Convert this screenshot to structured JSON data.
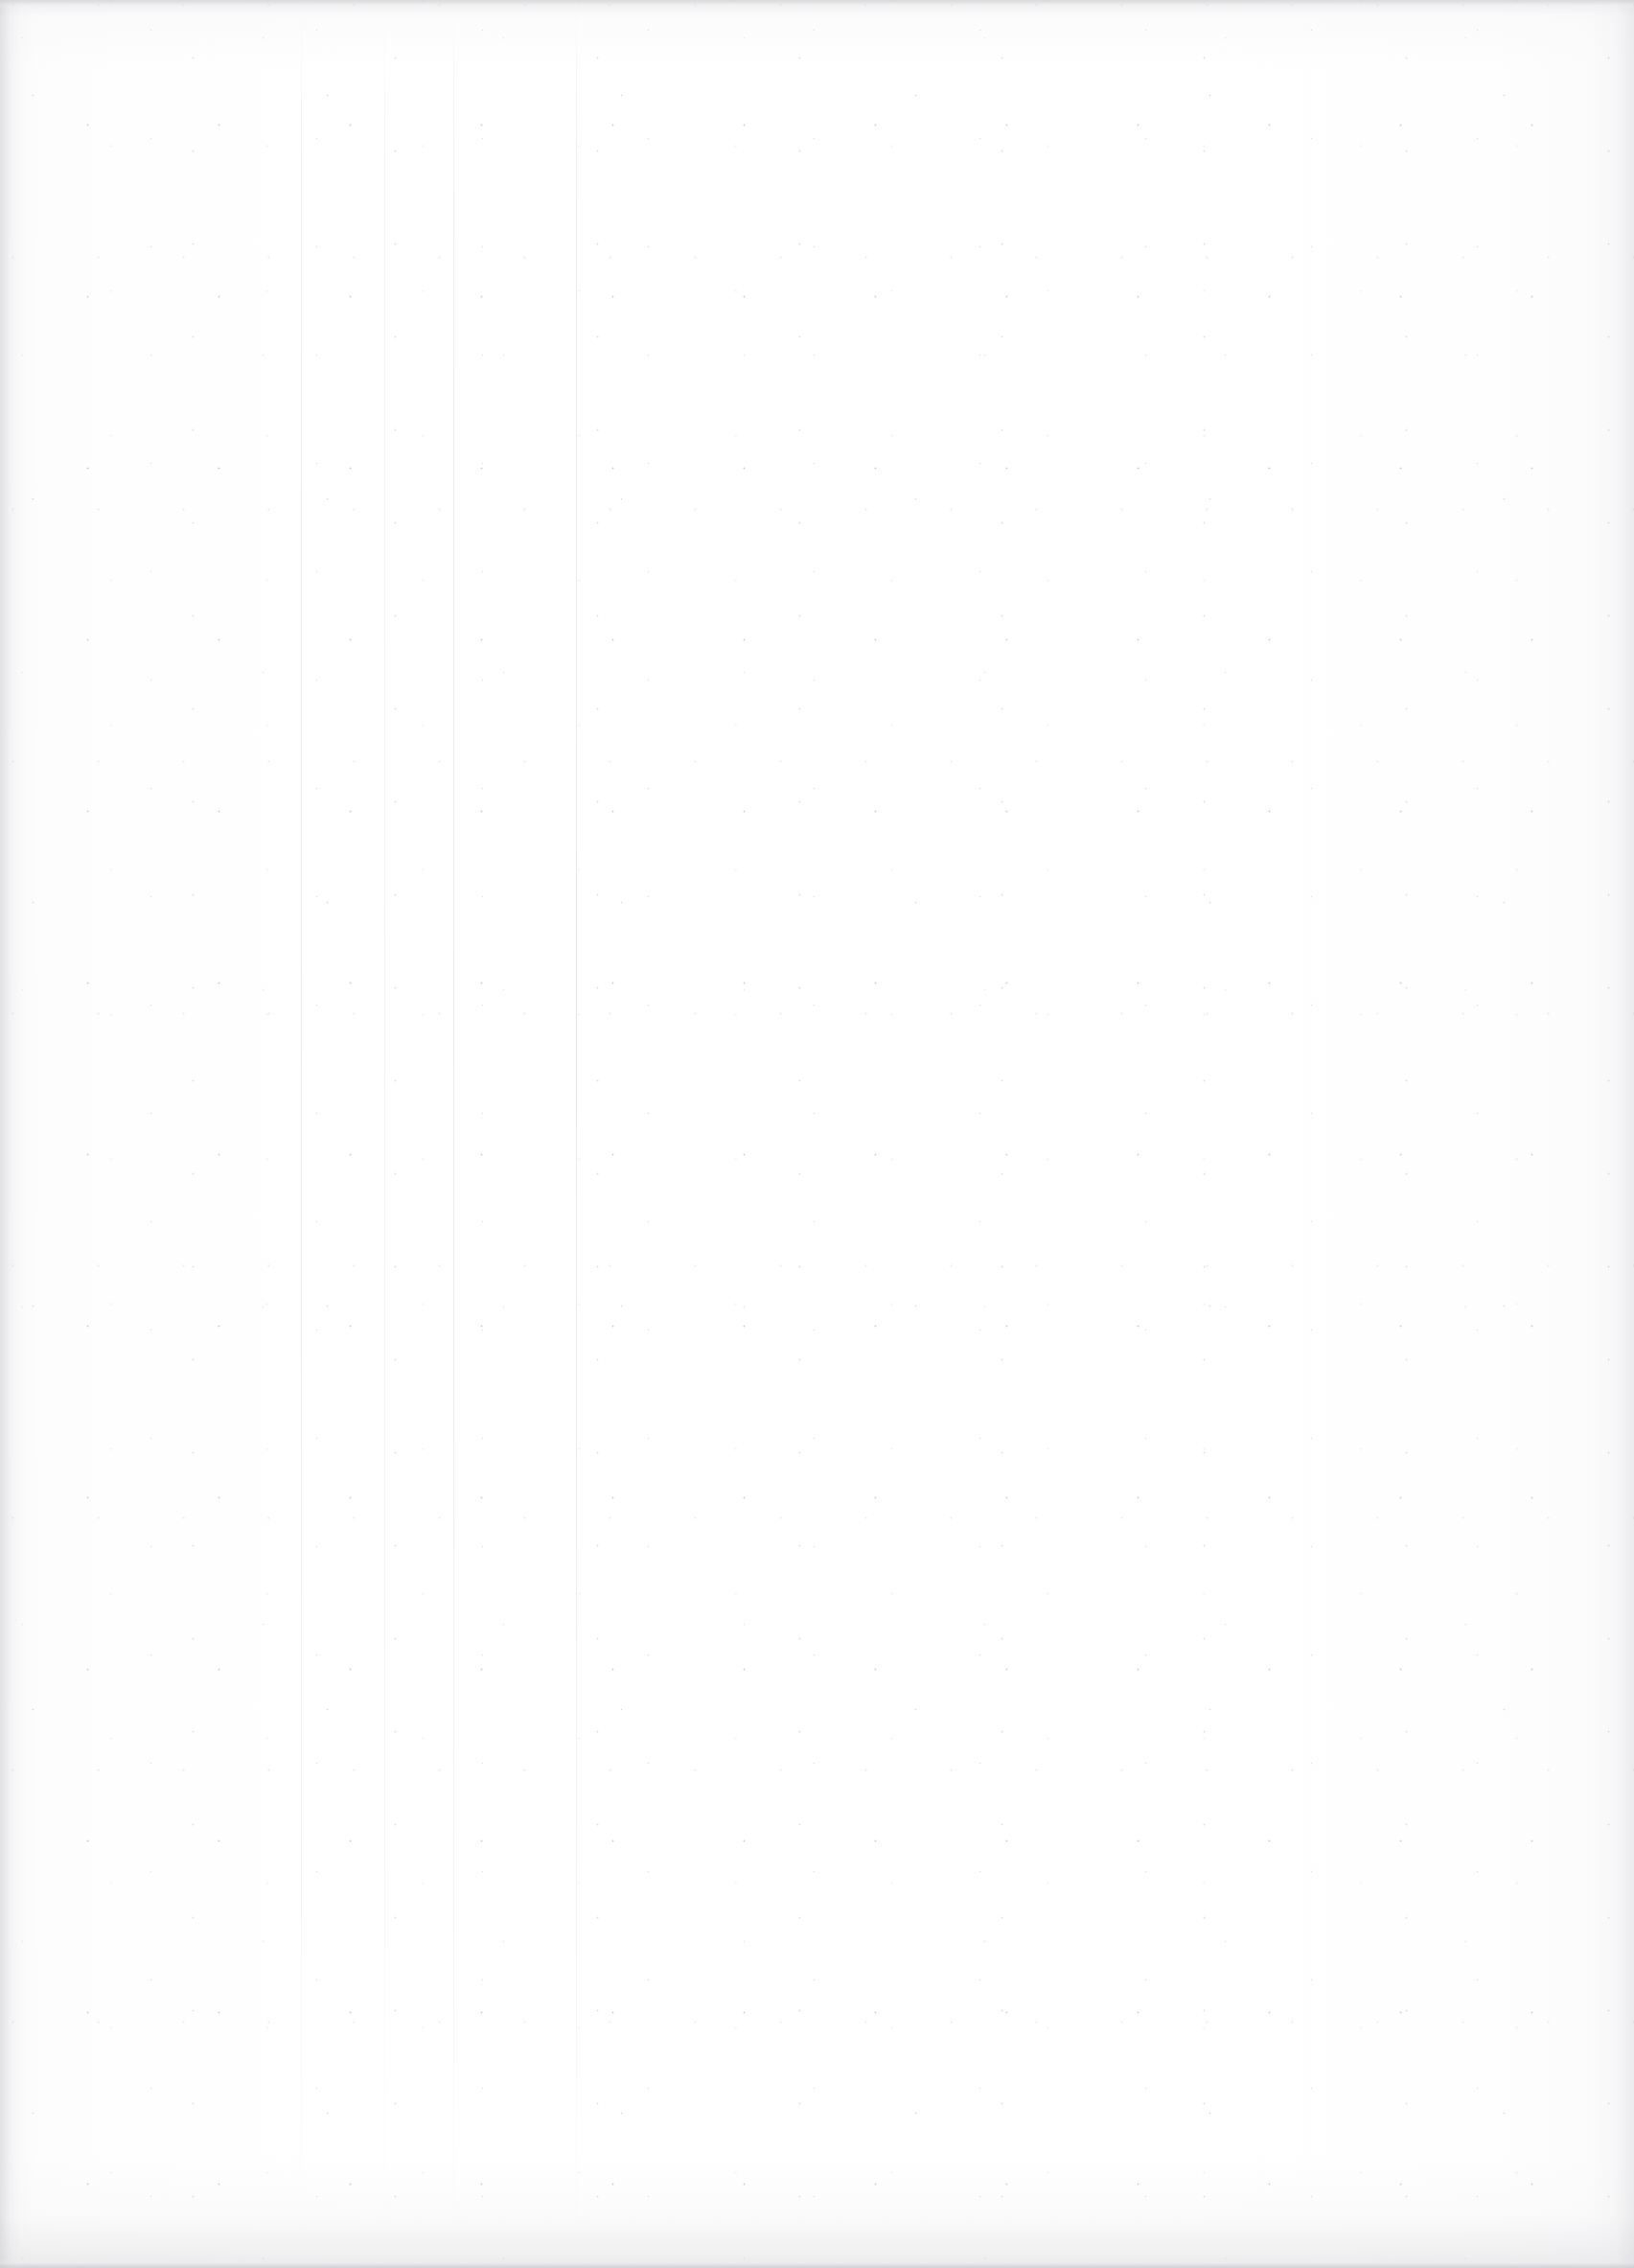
{
  "page": {
    "kind": "scanned-document-page",
    "state": "blank",
    "width_px": 1705,
    "height_px": 2366,
    "visible_text": ""
  },
  "paper": {
    "base_color": "#fefefe",
    "highlight_color": "#ffffff",
    "warm_tint_color": "#fdfdfd",
    "edge_tone_color": "#f6f6f7"
  },
  "artifacts": {
    "gutter_shadow": {
      "name": "left-binding-shadow",
      "edge": "left",
      "width_px": 34,
      "color": "#c4c4c8"
    },
    "right_edge_falloff": {
      "name": "right-page-edge-shadow",
      "edge": "right",
      "width_px": 48,
      "color": "#cdcdd1"
    },
    "top_bed_edge": {
      "name": "scanner-bed-top-edge",
      "height_px": 10,
      "color": "#d0d0d4"
    },
    "bottom_bed_edge": {
      "name": "scanner-bed-bottom-edge",
      "height_px": 10,
      "color": "#c8c8cd"
    },
    "roller_streaks": [
      {
        "name": "streak-1",
        "x_px": 314,
        "opacity": 0.55,
        "color": "#cecdd4"
      },
      {
        "name": "streak-2",
        "x_px": 401,
        "opacity": 0.45,
        "color": "#cecdd4"
      },
      {
        "name": "streak-3",
        "x_px": 473,
        "opacity": 0.7,
        "color": "#c6c6cd"
      },
      {
        "name": "streak-4",
        "x_px": 601,
        "opacity": 0.75,
        "color": "#c6c6cd"
      }
    ],
    "speckle": {
      "name": "dust-and-fibre-noise",
      "density": "sparse",
      "dark_speck_color": "#80808a",
      "mid_speck_color": "#a8a8b0",
      "light_speck_color": "#c4c4cc"
    },
    "sensor_banding": {
      "name": "ccd-vertical-banding",
      "period_px": 42,
      "color": "#f3f3f6"
    },
    "scanlines": {
      "name": "horizontal-scan-texture",
      "period_px": 4,
      "color": "#f4f4f7"
    }
  },
  "content_area": {
    "name": "text-block-region",
    "left_px": 196,
    "top_px": 210,
    "width_px": 1320,
    "height_px": 1960,
    "text": ""
  }
}
